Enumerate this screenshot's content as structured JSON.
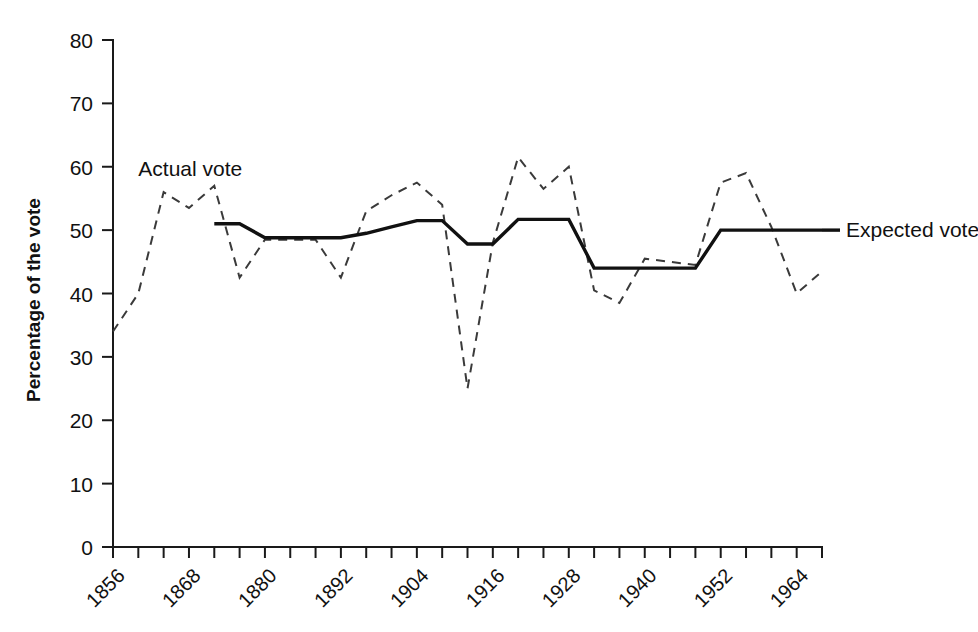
{
  "chart_data": {
    "type": "line",
    "title": "",
    "xlabel": "",
    "ylabel": "Percentage of the vote",
    "xlim": [
      1856,
      1968
    ],
    "ylim": [
      0,
      80
    ],
    "grid": false,
    "legend_position": "inline-annotations",
    "y_ticks": [
      "0",
      "10",
      "20",
      "30",
      "40",
      "50",
      "60",
      "70",
      "80"
    ],
    "y_tick_values": [
      0,
      10,
      20,
      30,
      40,
      50,
      60,
      70,
      80
    ],
    "x_ticks": [
      "1856",
      "1868",
      "1880",
      "1892",
      "1904",
      "1916",
      "1928",
      "1940",
      "1952",
      "1964"
    ],
    "x_tick_values": [
      1856,
      1868,
      1880,
      1892,
      1904,
      1916,
      1928,
      1940,
      1952,
      1964
    ],
    "x_minor_tick_values": [
      1856,
      1860,
      1864,
      1868,
      1872,
      1876,
      1880,
      1884,
      1888,
      1892,
      1896,
      1900,
      1904,
      1908,
      1912,
      1916,
      1920,
      1924,
      1928,
      1932,
      1936,
      1940,
      1944,
      1948,
      1952,
      1956,
      1960,
      1964,
      1968
    ],
    "series": [
      {
        "name": "Actual vote",
        "style": "dashed",
        "color": "#3a3a3a",
        "label_x": 1860,
        "label_y": 58.5,
        "x": [
          1856,
          1860,
          1864,
          1868,
          1872,
          1876,
          1880,
          1884,
          1888,
          1892,
          1896,
          1900,
          1904,
          1908,
          1912,
          1916,
          1920,
          1924,
          1928,
          1932,
          1936,
          1940,
          1944,
          1948,
          1952,
          1956,
          1960,
          1964,
          1968
        ],
        "values": [
          34,
          40,
          56,
          53.5,
          57,
          42.5,
          48.5,
          48.5,
          48.5,
          42.5,
          53,
          55.5,
          57.5,
          54,
          25,
          48,
          61.5,
          56.5,
          60,
          40.5,
          38.5,
          45.5,
          45,
          44.5,
          57.5,
          59,
          50.5,
          40,
          43.5
        ]
      },
      {
        "name": "Expected vote",
        "style": "solid",
        "color": "#111111",
        "label_x": 1968,
        "label_y": 50,
        "x": [
          1872,
          1876,
          1880,
          1884,
          1888,
          1892,
          1896,
          1900,
          1904,
          1908,
          1912,
          1916,
          1920,
          1924,
          1928,
          1932,
          1936,
          1940,
          1944,
          1948,
          1952,
          1956,
          1960,
          1964,
          1968
        ],
        "values": [
          51,
          51,
          48.8,
          48.8,
          48.8,
          48.8,
          49.5,
          50.5,
          51.5,
          51.5,
          47.8,
          47.8,
          51.7,
          51.7,
          51.7,
          44,
          44,
          44,
          44,
          44,
          50,
          50,
          50,
          50,
          50
        ]
      }
    ]
  },
  "annotations": {
    "actual_label": "Actual vote",
    "expected_label": "Expected vote"
  }
}
